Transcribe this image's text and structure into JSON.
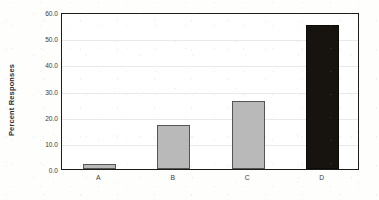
{
  "chart_data": {
    "type": "bar",
    "title": "",
    "subtitle": "",
    "xlabel": "",
    "ylabel": "Percent Responses",
    "categories": [
      "A",
      "B",
      "C",
      "D"
    ],
    "values": [
      2.0,
      17.0,
      26.0,
      55.0
    ],
    "series": [
      {
        "name": "Percent Responses",
        "values": [
          2.0,
          17.0,
          26.0,
          55.0
        ]
      }
    ],
    "ylim": [
      0.0,
      60.0
    ],
    "ytick_values": [
      0.0,
      10.0,
      20.0,
      30.0,
      40.0,
      50.0,
      60.0
    ],
    "ytick_labels": [
      "0.0",
      "10.0",
      "20.0",
      "30.0",
      "40.0",
      "50.0",
      "60.0"
    ],
    "xtick_labels": [
      "A",
      "B",
      "C",
      "D"
    ],
    "grid": true,
    "grid_axis": "y",
    "legend": false,
    "legend_position": "none",
    "annotations": [],
    "bar_colors": [
      "#b9b9b9",
      "#b9b9b9",
      "#b9b9b9",
      "#17140f"
    ],
    "colors": {
      "bar_gray": "#b9b9b9",
      "bar_dark": "#17140f",
      "bar_border": "#555555",
      "axis_frame": "#1c1c1c",
      "gridline": "#e9e9e9",
      "text": "#3a3a3a",
      "background": "#fefefd"
    }
  }
}
